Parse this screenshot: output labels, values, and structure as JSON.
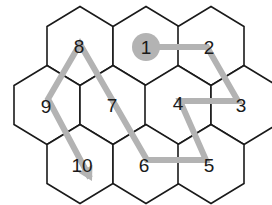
{
  "diagram": {
    "type": "hex-grid-path",
    "colors": {
      "hex_stroke": "#1a1a1a",
      "hex_fill": "#ffffff",
      "path": "#b3b3b3",
      "start_marker": "#b3b3b3",
      "label": "#1a1a1a"
    },
    "hexes": [
      {
        "id": "h-top-0",
        "row": 0,
        "cx": 80,
        "cy": 46,
        "label": "8"
      },
      {
        "id": "h-top-1",
        "row": 0,
        "cx": 146,
        "cy": 46,
        "label": "1"
      },
      {
        "id": "h-top-2",
        "row": 0,
        "cx": 211,
        "cy": 46,
        "label": "2"
      },
      {
        "id": "h-mid-0",
        "row": 1,
        "cx": 47,
        "cy": 105,
        "label": "9"
      },
      {
        "id": "h-mid-1",
        "row": 1,
        "cx": 113,
        "cy": 105,
        "label": "7"
      },
      {
        "id": "h-mid-2",
        "row": 1,
        "cx": 178,
        "cy": 105,
        "label": "4"
      },
      {
        "id": "h-mid-3",
        "row": 1,
        "cx": 244,
        "cy": 105,
        "label": "3"
      },
      {
        "id": "h-bot-0",
        "row": 2,
        "cx": 80,
        "cy": 164,
        "label": "10"
      },
      {
        "id": "h-bot-1",
        "row": 2,
        "cx": 146,
        "cy": 164,
        "label": "6"
      },
      {
        "id": "h-bot-2",
        "row": 2,
        "cx": 211,
        "cy": 164,
        "label": "5"
      }
    ],
    "labels": [
      {
        "text": "1",
        "x": 146,
        "y": 47
      },
      {
        "text": "2",
        "x": 209,
        "y": 47
      },
      {
        "text": "3",
        "x": 241,
        "y": 105
      },
      {
        "text": "4",
        "x": 178,
        "y": 103
      },
      {
        "text": "5",
        "x": 209,
        "y": 165
      },
      {
        "text": "6",
        "x": 144,
        "y": 165
      },
      {
        "text": "7",
        "x": 112,
        "y": 105
      },
      {
        "text": "8",
        "x": 79,
        "y": 46
      },
      {
        "text": "9",
        "x": 46,
        "y": 106
      },
      {
        "text": "10",
        "x": 82,
        "y": 165
      }
    ],
    "path_sequence": [
      "1",
      "2",
      "3",
      "4",
      "5",
      "6",
      "7",
      "8",
      "9",
      "10"
    ],
    "path_points": "146,47 207,47 238,101 180,101 206,160 147,160 80,44 48,99 90,178",
    "start_marker": {
      "cx": 146,
      "cy": 47,
      "r": 14
    },
    "end_arrow": {
      "tip_x": 92,
      "tip_y": 181
    }
  }
}
